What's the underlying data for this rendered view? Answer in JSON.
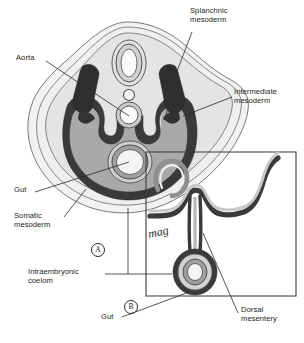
{
  "figure": {
    "panels": [
      {
        "id": "A",
        "label": "A"
      },
      {
        "id": "B",
        "label": "B"
      }
    ],
    "signature": "mag",
    "labels": [
      {
        "name": "splanchnic-mesoderm",
        "text": "Splanchnic\nmesoderm"
      },
      {
        "name": "aorta",
        "text": "Aorta"
      },
      {
        "name": "intermediate-mesoderm",
        "text": "Intermediate\nmesoderm"
      },
      {
        "name": "gut-a",
        "text": "Gut"
      },
      {
        "name": "somatic-mesoderm",
        "text": "Somatic\nmesoderm"
      },
      {
        "name": "intraembryonic-coelom",
        "text": "Intraembryonic\ncoelom"
      },
      {
        "name": "gut-b",
        "text": "Gut"
      },
      {
        "name": "dorsal-mesentery",
        "text": "Dorsal\nmesentery"
      }
    ],
    "colors": {
      "ink": "#1c1c1c",
      "dark_mesoderm": "#3a3a3a",
      "coelom_grey": "#a9a9a9",
      "tissue_light": "#d9d9d9",
      "tissue_pale": "#ececec",
      "outline": "#4a4a4a",
      "background": "#ffffff"
    }
  }
}
